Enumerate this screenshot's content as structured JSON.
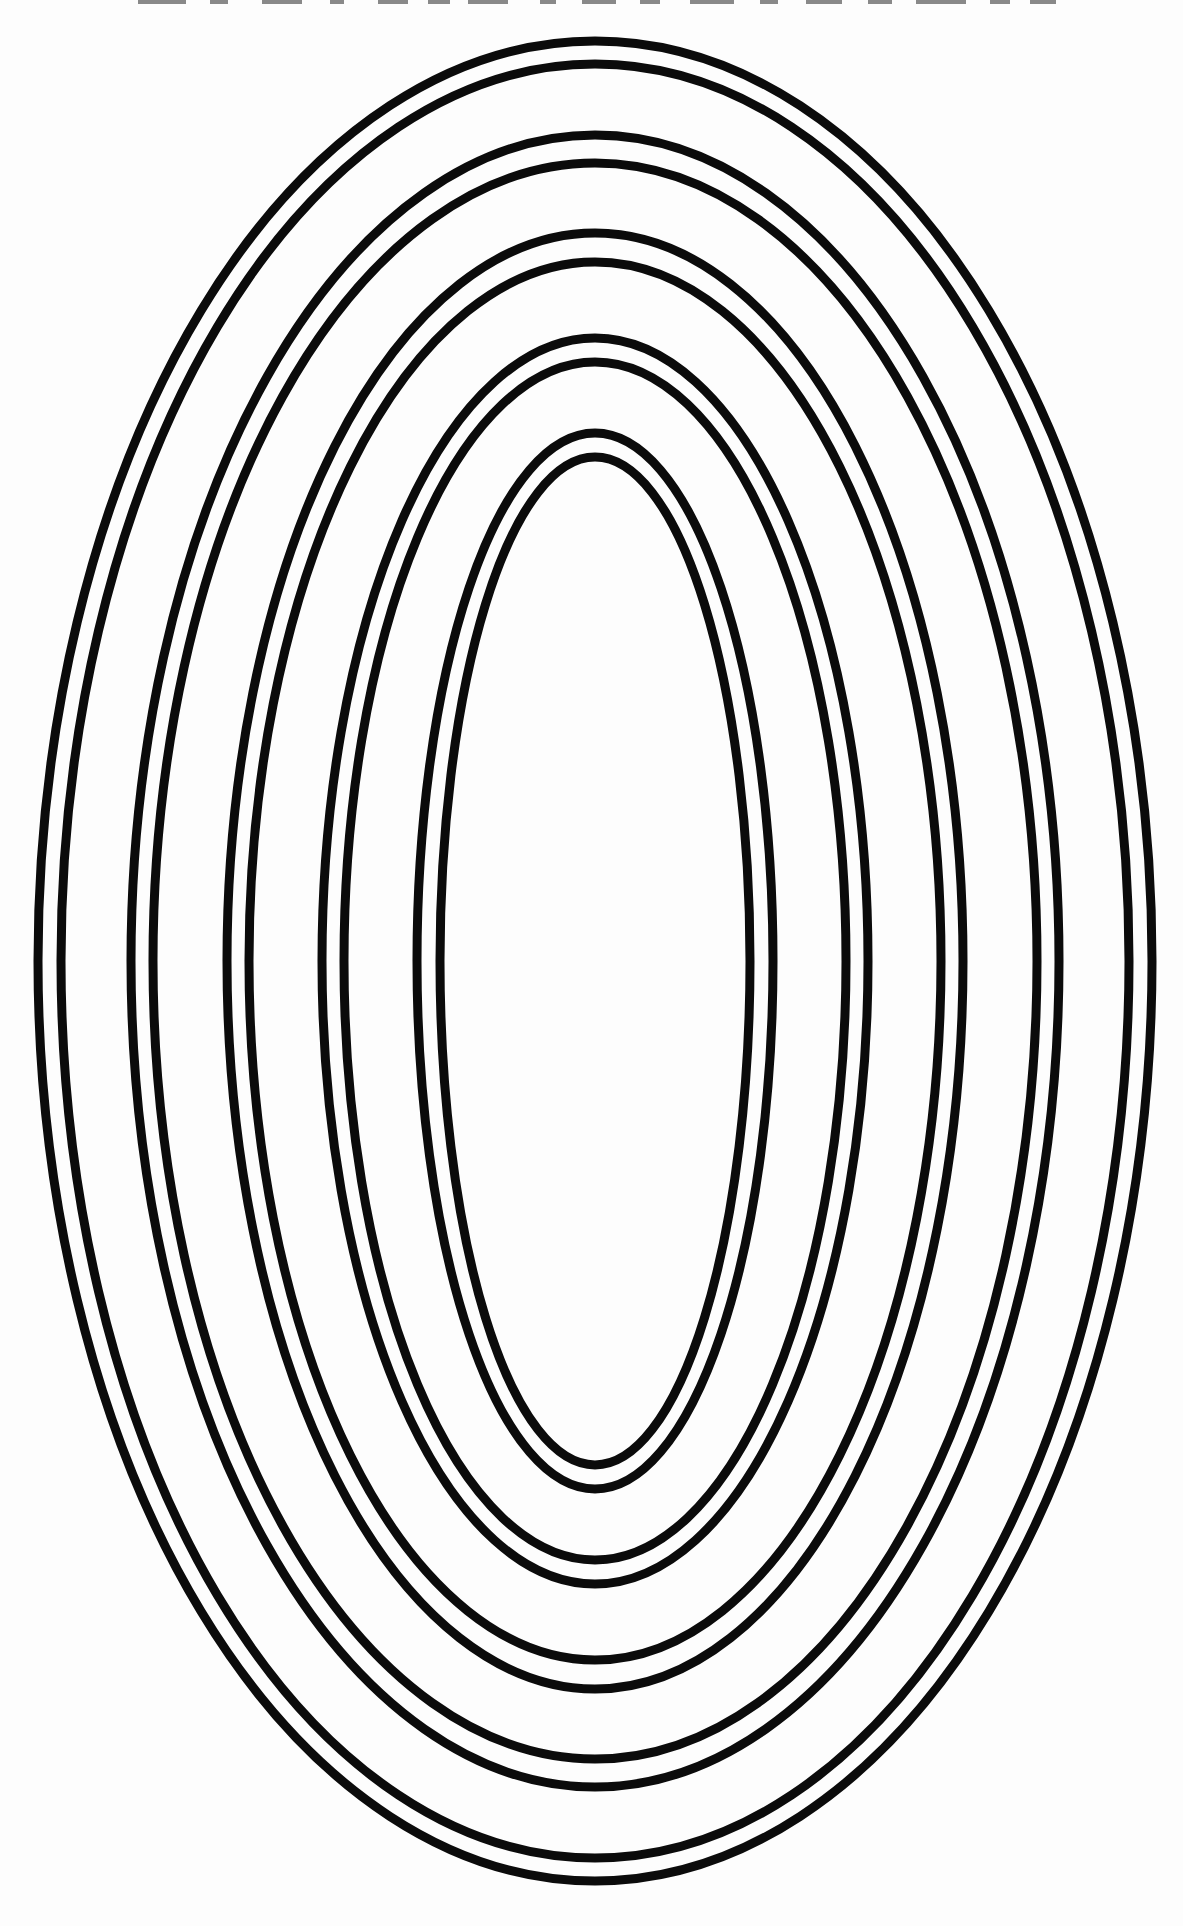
{
  "page": {
    "width": 1183,
    "height": 1926,
    "background_color": "#fdfdfd"
  },
  "figure": {
    "type": "concentric-ellipses",
    "ring_count": 5,
    "lines_per_ring": 2,
    "center": {
      "x": 595,
      "y": 961
    },
    "stroke_color": "#0b0b0b",
    "stroke_width": 9,
    "rings": [
      {
        "name": "ring-1-outermost",
        "outer": {
          "rx": 557,
          "ry": 920
        },
        "inner": {
          "rx": 534,
          "ry": 897
        }
      },
      {
        "name": "ring-2",
        "outer": {
          "rx": 464,
          "ry": 826
        },
        "inner": {
          "rx": 442,
          "ry": 798
        }
      },
      {
        "name": "ring-3",
        "outer": {
          "rx": 368,
          "ry": 728
        },
        "inner": {
          "rx": 346,
          "ry": 699
        }
      },
      {
        "name": "ring-4",
        "outer": {
          "rx": 273,
          "ry": 623
        },
        "inner": {
          "rx": 251,
          "ry": 599
        }
      },
      {
        "name": "ring-5-innermost",
        "outer": {
          "rx": 178,
          "ry": 528
        },
        "inner": {
          "rx": 155,
          "ry": 504
        }
      }
    ]
  },
  "artifacts": {
    "top_edge_noise": {
      "color": "#2a2a2a",
      "opacity": 0.55,
      "y": 0,
      "height": 4,
      "segments": [
        {
          "x": 138,
          "w": 48
        },
        {
          "x": 210,
          "w": 18
        },
        {
          "x": 262,
          "w": 40
        },
        {
          "x": 330,
          "w": 14
        },
        {
          "x": 378,
          "w": 30
        },
        {
          "x": 428,
          "w": 22
        },
        {
          "x": 468,
          "w": 40
        },
        {
          "x": 540,
          "w": 16
        },
        {
          "x": 582,
          "w": 34
        },
        {
          "x": 640,
          "w": 20
        },
        {
          "x": 690,
          "w": 44
        },
        {
          "x": 760,
          "w": 18
        },
        {
          "x": 806,
          "w": 36
        },
        {
          "x": 868,
          "w": 24
        },
        {
          "x": 916,
          "w": 50
        },
        {
          "x": 990,
          "w": 20
        },
        {
          "x": 1030,
          "w": 26
        }
      ]
    }
  }
}
